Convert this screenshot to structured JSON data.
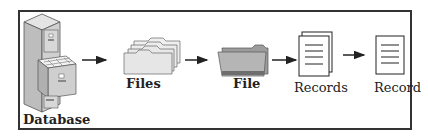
{
  "diagram": {
    "type": "hierarchy-flow",
    "nodes": [
      {
        "id": "database",
        "label": "Database",
        "icon": "filing-cabinet-icon"
      },
      {
        "id": "files",
        "label": "Files",
        "icon": "stacked-folders-icon"
      },
      {
        "id": "file",
        "label": "File",
        "icon": "open-folder-icon"
      },
      {
        "id": "records",
        "label": "Records",
        "icon": "stacked-documents-icon"
      },
      {
        "id": "record",
        "label": "Record",
        "icon": "document-icon"
      }
    ],
    "edges": [
      {
        "from": "database",
        "to": "files"
      },
      {
        "from": "files",
        "to": "file"
      },
      {
        "from": "file",
        "to": "records"
      },
      {
        "from": "records",
        "to": "record"
      }
    ]
  },
  "labels": {
    "database": "Database",
    "files": "Files",
    "file": "File",
    "records": "Records",
    "record": "Record"
  },
  "colors": {
    "border": "#333333",
    "cabinet": "#c8c8c8",
    "folder": "#e6e6e6",
    "folder_dark": "#9a9a9a",
    "ink": "#222222"
  }
}
